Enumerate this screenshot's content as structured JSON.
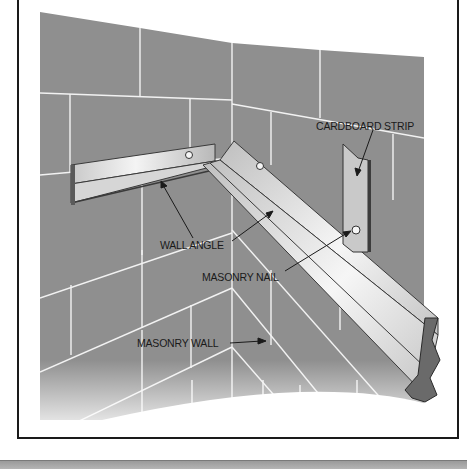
{
  "diagram": {
    "labels": {
      "cardboard_strip": "CARDBOARD STRIP",
      "wall_angle": "WALL ANGLE",
      "masonry_nail": "MASONRY NAIL",
      "masonry_wall": "MASONRY WALL"
    },
    "colors": {
      "wall": "#8f8f8f",
      "mortar": "#f2f2f2",
      "metal_light": "#e8e8e8",
      "metal_mid": "#bdbdbd",
      "metal_dark": "#5a5a5a",
      "frame": "#1a1a1a",
      "text": "#1a1a1a"
    }
  }
}
